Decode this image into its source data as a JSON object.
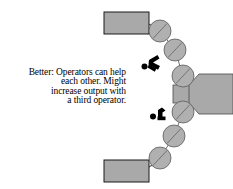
{
  "figure": {
    "type": "process-flow-diagram",
    "caption": {
      "lines": [
        "Better: Operators can help",
        "each other. Might",
        "increase output with",
        "a third operator."
      ]
    },
    "colors": {
      "fill_gray": "#a9a9a9",
      "station_gray": "#b0b0b0",
      "outline": "#000000",
      "operator_black": "#000000",
      "background": "#ffffff"
    },
    "elements": {
      "machine_label": "central-machine",
      "input_bin_label": "top-output-bin",
      "output_bin_label": "bottom-output-bin",
      "station_count": "6",
      "operator_count": "2"
    },
    "stations": [
      {
        "name": "station-1",
        "cx": 160,
        "cy": 31,
        "r": 11
      },
      {
        "name": "station-2",
        "cx": 175,
        "cy": 50,
        "r": 11
      },
      {
        "name": "station-3",
        "cx": 183,
        "cy": 76,
        "r": 11
      },
      {
        "name": "station-4",
        "cx": 183,
        "cy": 112,
        "r": 11
      },
      {
        "name": "station-5",
        "cx": 174,
        "cy": 136,
        "r": 11
      },
      {
        "name": "station-6",
        "cx": 160,
        "cy": 158,
        "r": 11
      }
    ],
    "operators": [
      {
        "name": "operator-upper",
        "x": 148,
        "y": 60
      },
      {
        "name": "operator-lower",
        "x": 157,
        "y": 112
      }
    ],
    "bins": [
      {
        "name": "top-bin",
        "x": 104,
        "y": 12,
        "w": 45,
        "h": 22
      },
      {
        "name": "bottom-bin",
        "x": 104,
        "y": 160,
        "w": 45,
        "h": 22
      }
    ]
  }
}
